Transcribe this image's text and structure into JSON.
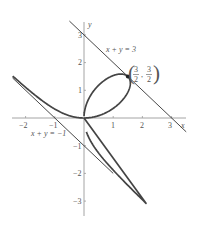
{
  "chart_data": {
    "type": "line",
    "title": "",
    "xlabel": "x",
    "ylabel": "y",
    "xlim": [
      -2.45,
      3.5
    ],
    "ylim": [
      -3.5,
      3.4
    ],
    "grid": false,
    "x_ticks": [
      -2,
      -1,
      1,
      2,
      3
    ],
    "x_tick_labels": [
      "−2",
      "−1",
      "1",
      "2",
      "3"
    ],
    "y_ticks": [
      -3,
      -2,
      -1,
      1,
      2,
      3
    ],
    "y_tick_labels": [
      "−3",
      "−2",
      "−1",
      "1",
      "2",
      "3"
    ],
    "series": [
      {
        "name": "folium of Descartes x^3 + y^3 = 3xy",
        "kind": "parametric",
        "x_expr": "3t/(1+t^3)",
        "y_expr": "3t^2/(1+t^3)",
        "color": "#444444"
      },
      {
        "name": "x + y = 3",
        "kind": "line",
        "equation": "x + y = 3",
        "x_range": [
          -0.5,
          3.5
        ],
        "color": "#333333"
      },
      {
        "name": "x + y = −1",
        "kind": "line",
        "equation": "x + y = -1",
        "x_range": [
          -2.45,
          1.0
        ],
        "color": "#333333"
      }
    ],
    "annotations": [
      {
        "text": "x + y = 3",
        "x": 1.35,
        "y": 2.55
      },
      {
        "text": "x + y = −1",
        "x": -1.9,
        "y": -0.6
      },
      {
        "text": "(3/2, 3/2)",
        "x": 1.5,
        "y": 1.5,
        "marker": "point",
        "numerator_x": "3",
        "denominator_x": "2",
        "numerator_y": "3",
        "denominator_y": "2"
      }
    ]
  },
  "labels": {
    "x_axis": "x",
    "y_axis": "y",
    "line_upper": "x + y = 3",
    "line_lower": "x + y = −1",
    "point_num_x": "3",
    "point_den_x": "2",
    "point_num_y": "3",
    "point_den_y": "2",
    "tick_x_m2": "−2",
    "tick_x_m1": "−1",
    "tick_x_1": "1",
    "tick_x_2": "2",
    "tick_x_3": "3",
    "tick_y_3": "3",
    "tick_y_2": "2",
    "tick_y_1": "1",
    "tick_y_m1": "−1",
    "tick_y_m2": "−2",
    "tick_y_m3": "−3"
  }
}
